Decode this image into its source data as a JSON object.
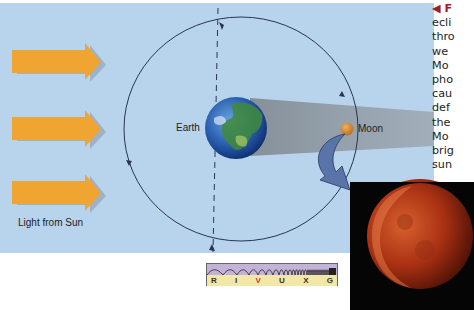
{
  "figure": {
    "background_color": "#b7d4ec",
    "labels": {
      "earth": "Earth",
      "moon": "Moon",
      "light_source": "Light from Sun"
    },
    "arrows": {
      "count": 3,
      "color": "#f0a431"
    }
  },
  "caption": {
    "lead_marker": "◀ F",
    "lines": [
      "ecli",
      "thro",
      "we",
      "Mo",
      "pho",
      "cau",
      "def",
      "the",
      "Mo",
      "brig",
      "sun"
    ]
  },
  "spectrum_bar": {
    "bands": [
      "R",
      "I",
      "V",
      "U",
      "X",
      "G"
    ],
    "highlighted_band": "V"
  },
  "photo": {
    "subject": "lunar-eclipse-moon",
    "moon_color": "#b23a16"
  }
}
